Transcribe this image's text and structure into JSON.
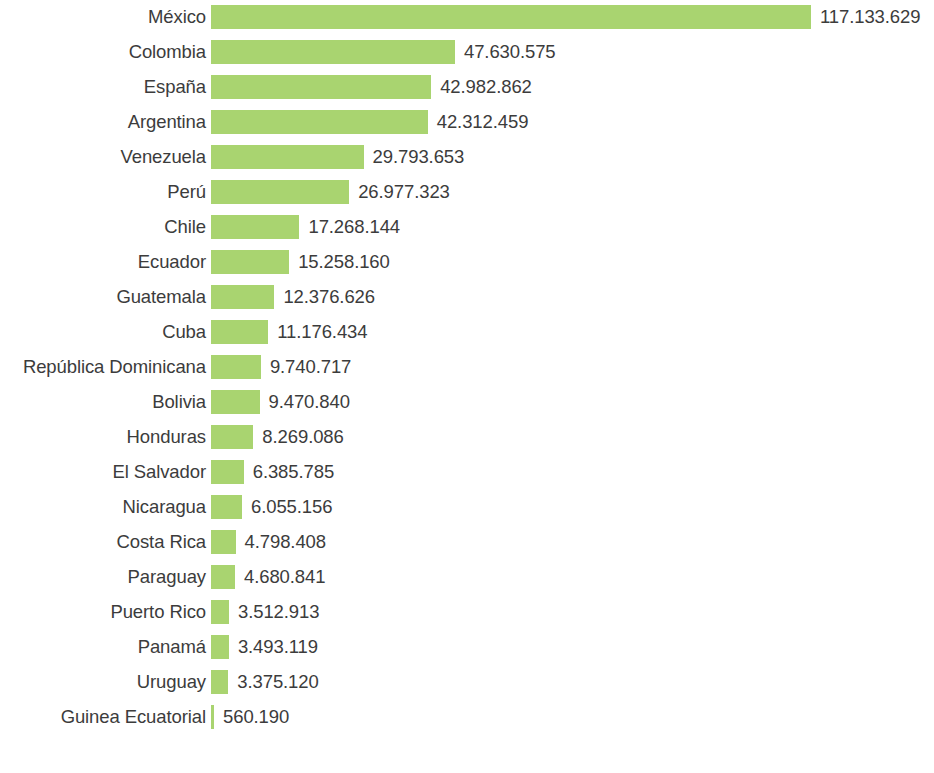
{
  "chart_data": {
    "type": "bar",
    "orientation": "horizontal",
    "title": "",
    "subtitle": "",
    "xlabel": "",
    "ylabel": "",
    "grid": false,
    "legend": null,
    "axis_visible": false,
    "tick_labels": [],
    "xlim": [
      0,
      117133629
    ],
    "bar_color": "#a9d470",
    "text_color": "#3c3c3c",
    "background_color": "#ffffff",
    "number_format": "dot-thousands-separator",
    "categories": [
      "México",
      "Colombia",
      "España",
      "Argentina",
      "Venezuela",
      "Perú",
      "Chile",
      "Ecuador",
      "Guatemala",
      "Cuba",
      "República Dominicana",
      "Bolivia",
      "Honduras",
      "El Salvador",
      "Nicaragua",
      "Costa Rica",
      "Paraguay",
      "Puerto Rico",
      "Panamá",
      "Uruguay",
      "Guinea Ecuatorial"
    ],
    "values": [
      117133629,
      47630575,
      42982862,
      42312459,
      29793653,
      26977323,
      17268144,
      15258160,
      12376626,
      11176434,
      9740717,
      9470840,
      8269086,
      6385785,
      6055156,
      4798408,
      4680841,
      3512913,
      3493119,
      3375120,
      560190
    ],
    "value_labels": [
      "117.133.629",
      "47.630.575",
      "42.982.862",
      "42.312.459",
      "29.793.653",
      "26.977.323",
      "17.268.144",
      "15.258.160",
      "12.376.626",
      "11.176.434",
      "9.740.717",
      "9.470.840",
      "8.269.086",
      "6.385.785",
      "6.055.156",
      "4.798.408",
      "4.680.841",
      "3.512.913",
      "3.493.119",
      "3.375.120",
      "560.190"
    ]
  }
}
